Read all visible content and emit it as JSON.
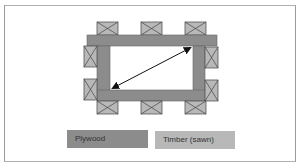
{
  "diagram": {
    "colors": {
      "plywood": "#8c8c8c",
      "timber": "#b8b8b8",
      "frame_border": "#9a9a9a",
      "arrow": "#111111",
      "background": "#ffffff"
    },
    "arrow": {
      "type": "double-headed-diagonal",
      "meaning": "diagonal-measurement"
    },
    "legend": [
      {
        "label": "Plywood",
        "material": "plywood"
      },
      {
        "label": "Timber (sawn)",
        "material": "timber"
      }
    ]
  }
}
